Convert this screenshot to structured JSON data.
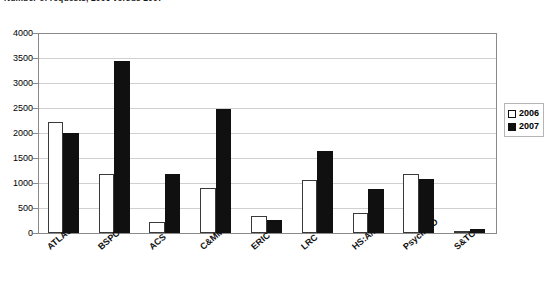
{
  "chart_data": {
    "type": "bar",
    "title": "Number of requests, 2006 versus 2007",
    "xlabel": "",
    "ylabel": "",
    "ylim": [
      0,
      4000
    ],
    "ytick_step": 500,
    "yticks": [
      0,
      500,
      1000,
      1500,
      2000,
      2500,
      3000,
      3500,
      4000
    ],
    "ytick_labels": [
      "0",
      "500",
      "1000",
      "1500",
      "2000",
      "2500",
      "3000",
      "3500",
      "4000"
    ],
    "grid": true,
    "legend_position": "right",
    "categories": [
      "ATLAS",
      "BSPC",
      "ACS",
      "C&MMC",
      "ERIC",
      "LRC",
      "HS:A/N",
      "PsycINFO",
      "S&TC"
    ],
    "series": [
      {
        "name": "2006",
        "color": "#ffffff",
        "edge_color": "#3a3a3a",
        "values": [
          2220,
          1180,
          220,
          900,
          340,
          1070,
          400,
          1180,
          30
        ]
      },
      {
        "name": "2007",
        "color": "#101010",
        "edge_color": "#101010",
        "values": [
          2000,
          3450,
          1180,
          2490,
          260,
          1640,
          880,
          1080,
          90
        ]
      }
    ]
  },
  "legend": {
    "items": [
      {
        "label": "2006",
        "swatch": "open-square-swatch"
      },
      {
        "label": "2007",
        "swatch": "filled-square-swatch"
      }
    ]
  }
}
